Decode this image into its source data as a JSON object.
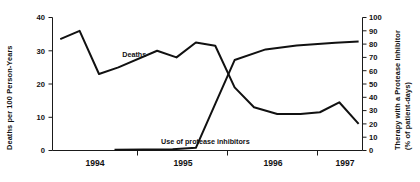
{
  "chart_data": {
    "type": "line",
    "title": "",
    "xlabel": "",
    "ylabel": "Deaths per 100 Person-Years",
    "y2label": "Therapy with a Protease Inhibitor (% of patient-days)",
    "grid": false,
    "legend_position": "inline-annotations",
    "xlim": [
      1993.75,
      1997.75
    ],
    "ylim": [
      0,
      40
    ],
    "y2lim": [
      0,
      100
    ],
    "yticks": [
      0,
      10,
      20,
      30,
      40
    ],
    "y2ticks": [
      0,
      10,
      20,
      30,
      40,
      50,
      60,
      70,
      80,
      90,
      100
    ],
    "xticks": [
      1994.0,
      1995.0,
      1996.0,
      1997.0
    ],
    "xtick_labels": [
      "1994",
      "1995",
      "1996",
      "1997"
    ],
    "xtick_label_positions": [
      1994.5,
      1995.5,
      1996.5,
      1997.25
    ],
    "series": [
      {
        "name": "Deaths",
        "axis": "left",
        "units": "deaths per 100 person-years",
        "x": [
          1993.85,
          1994.1,
          1994.35,
          1994.6,
          1995.1,
          1995.35,
          1995.6,
          1995.85,
          1996.1,
          1996.35,
          1996.65,
          1996.95,
          1997.2,
          1997.45,
          1997.7
        ],
        "y": [
          33.5,
          36.0,
          23.0,
          25.0,
          30.0,
          28.0,
          32.5,
          31.5,
          19.0,
          13.0,
          11.0,
          11.0,
          11.5,
          14.5,
          8.0
        ]
      },
      {
        "name": "Use of protease inhibitors",
        "axis": "right",
        "units": "% of patient-days",
        "x": [
          1994.55,
          1995.3,
          1995.6,
          1995.85,
          1996.1,
          1996.5,
          1996.9,
          1997.4,
          1997.7
        ],
        "y": [
          0.5,
          1.0,
          2.0,
          35.0,
          68.0,
          76.0,
          79.0,
          81.0,
          82.0
        ]
      }
    ],
    "annotations": [
      {
        "text": "Deaths",
        "x": 1994.65,
        "y": 28.0
      },
      {
        "text": "Use of protease inhibitors",
        "x": 1995.15,
        "y": 5.0
      }
    ]
  },
  "labels": {
    "y_axis_title": "Deaths per 100 Person-Years",
    "y2_axis_title_line1": "Therapy with a Protease Inhibitor",
    "y2_axis_title_line2": "(% of patient-days)",
    "y_ticks": [
      "0",
      "10",
      "20",
      "30",
      "40"
    ],
    "y2_ticks": [
      "0",
      "10",
      "20",
      "30",
      "40",
      "50",
      "60",
      "70",
      "80",
      "90",
      "100"
    ],
    "x_ticks": [
      "1994",
      "1995",
      "1996",
      "1997"
    ],
    "series_deaths": "Deaths",
    "series_pi": "Use of protease inhibitors"
  },
  "colors": {
    "ink": "#111111",
    "background": "#ffffff"
  }
}
